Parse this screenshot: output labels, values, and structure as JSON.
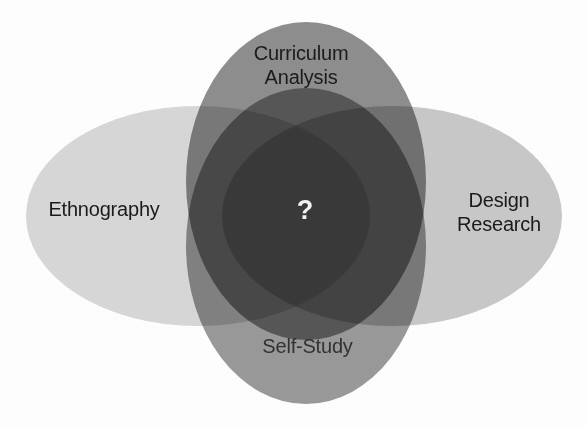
{
  "diagram": {
    "type": "venn",
    "set_count": 4,
    "background_color": "#ffffff",
    "center": {
      "label": "?",
      "name": "center-intersection",
      "text_color": "#f2f2f2",
      "fill_color": "#3a3a3a"
    },
    "sets": [
      {
        "id": "curriculum-analysis",
        "label": "Curriculum\nAnalysis",
        "position": "top",
        "orientation": "vertical",
        "fill_color": "#8f8f8f",
        "cx": 306,
        "cy": 181,
        "rx": 120,
        "ry": 159,
        "text_color": "#1b1b1b"
      },
      {
        "id": "ethnography",
        "label": "Ethnography",
        "position": "left",
        "orientation": "horizontal",
        "fill_color": "#d8d8d8",
        "cx": 198,
        "cy": 216,
        "rx": 172,
        "ry": 110,
        "text_color": "#1b1b1b"
      },
      {
        "id": "design-research",
        "label": "Design\nResearch",
        "position": "right",
        "orientation": "horizontal",
        "fill_color": "#c9c9c9",
        "cx": 392,
        "cy": 216,
        "rx": 170,
        "ry": 110,
        "text_color": "#1b1b1b"
      },
      {
        "id": "self-study",
        "label": "Self-Study",
        "position": "bottom",
        "orientation": "vertical",
        "fill_color": "#9a9a9a",
        "cx": 306,
        "cy": 246,
        "rx": 120,
        "ry": 158,
        "text_color": "#2a2a2a"
      }
    ]
  }
}
